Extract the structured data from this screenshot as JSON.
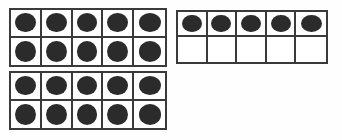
{
  "page": {
    "background_color": "#fefefe"
  },
  "style": {
    "dot_color": "#2b2b2b",
    "border_color": "#3a3a3a",
    "cell_fill_color": "#ffffff"
  },
  "chart_data": {
    "type": "table",
    "xlabel": "",
    "ylabel": "",
    "frames": [
      {
        "id": "frame-1",
        "label": "Ten frame 1",
        "columns": 5,
        "rows": 2,
        "filled_count": 10,
        "empty_count": 0,
        "cells": [
          [
            1,
            1,
            1,
            1,
            1
          ],
          [
            1,
            1,
            1,
            1,
            1
          ]
        ]
      },
      {
        "id": "frame-2",
        "label": "Ten frame 2",
        "columns": 5,
        "rows": 2,
        "filled_count": 5,
        "empty_count": 5,
        "cells": [
          [
            1,
            1,
            1,
            1,
            1
          ],
          [
            0,
            0,
            0,
            0,
            0
          ]
        ]
      },
      {
        "id": "frame-3",
        "label": "Ten frame 3",
        "columns": 5,
        "rows": 2,
        "filled_count": 10,
        "empty_count": 0,
        "cells": [
          [
            1,
            1,
            1,
            1,
            1
          ],
          [
            1,
            1,
            1,
            1,
            1
          ]
        ]
      }
    ],
    "total_filled": 25
  }
}
